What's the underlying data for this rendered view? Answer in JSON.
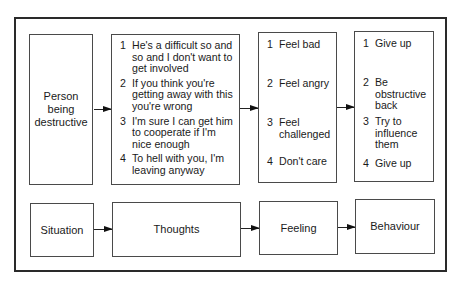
{
  "diagram": {
    "type": "flow",
    "rows": [
      {
        "name": "example",
        "stages": [
          {
            "id": "situation",
            "text": "Person being destructive"
          },
          {
            "id": "thoughts",
            "items": [
              {
                "n": "1",
                "text": "He's a difficult so and so and I don't want to get involved"
              },
              {
                "n": "2",
                "text": "If you think you're getting away with this you're wrong"
              },
              {
                "n": "3",
                "text": "I'm sure I can get him to cooperate if I'm nice enough"
              },
              {
                "n": "4",
                "text": "To hell with you, I'm leaving anyway"
              }
            ]
          },
          {
            "id": "feeling",
            "items": [
              {
                "n": "1",
                "text": "Feel bad"
              },
              {
                "n": "2",
                "text": "Feel angry"
              },
              {
                "n": "3",
                "text": "Feel challenged"
              },
              {
                "n": "4",
                "text": "Don't care"
              }
            ]
          },
          {
            "id": "behaviour",
            "items": [
              {
                "n": "1",
                "text": "Give up"
              },
              {
                "n": "2",
                "text": "Be obstructive back"
              },
              {
                "n": "3",
                "text": "Try to influence them"
              },
              {
                "n": "4",
                "text": "Give up"
              }
            ]
          }
        ]
      },
      {
        "name": "labels",
        "stages": [
          {
            "id": "situation",
            "text": "Situation"
          },
          {
            "id": "thoughts",
            "text": "Thoughts"
          },
          {
            "id": "feeling",
            "text": "Feeling"
          },
          {
            "id": "behaviour",
            "text": "Behaviour"
          }
        ]
      }
    ],
    "edges": [
      [
        "situation",
        "thoughts"
      ],
      [
        "thoughts",
        "feeling"
      ],
      [
        "feeling",
        "behaviour"
      ]
    ]
  }
}
